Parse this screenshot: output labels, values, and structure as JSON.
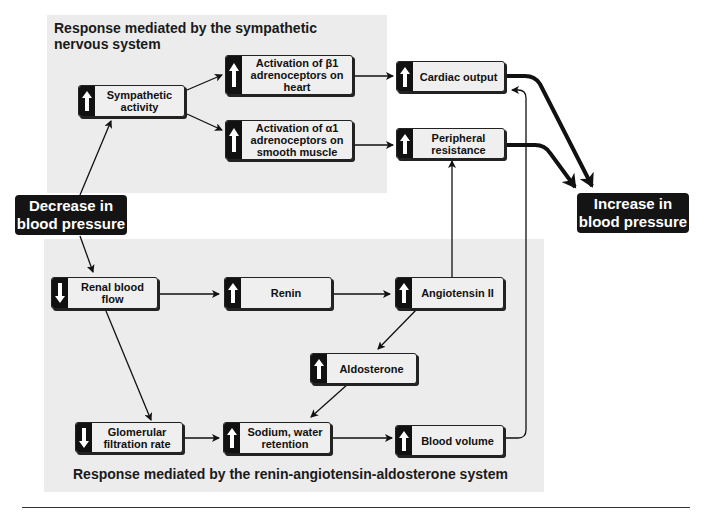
{
  "panels": {
    "sympathetic": {
      "title": "Response mediated by  the sympathetic nervous system"
    },
    "raas": {
      "title": "Response mediated by the renin-angiotensin-aldosterone system"
    }
  },
  "start": {
    "label": "Decrease in blood pressure"
  },
  "end": {
    "label": "Increase in blood pressure"
  },
  "nodes": {
    "sympathetic_activity": {
      "label": "Sympathetic activity",
      "direction": "up"
    },
    "beta1": {
      "label": "Activation of β1 adrenoceptors on heart",
      "direction": "up"
    },
    "alpha1": {
      "label": "Activation of α1 adrenoceptors on smooth muscle",
      "direction": "up"
    },
    "cardiac_output": {
      "label": "Cardiac output",
      "direction": "up"
    },
    "peripheral_resistance": {
      "label": "Peripheral resistance",
      "direction": "up"
    },
    "renal_blood_flow": {
      "label": "Renal blood flow",
      "direction": "down"
    },
    "renin": {
      "label": "Renin",
      "direction": "up"
    },
    "angiotensin_ii": {
      "label": "Angiotensin II",
      "direction": "up"
    },
    "aldosterone": {
      "label": "Aldosterone",
      "direction": "up"
    },
    "gfr": {
      "label": "Glomerular filtration rate",
      "direction": "down"
    },
    "sodium_water": {
      "label": "Sodium, water retention",
      "direction": "up"
    },
    "blood_volume": {
      "label": "Blood volume",
      "direction": "up"
    }
  },
  "icons": {
    "up": "arrow-up-icon",
    "down": "arrow-down-icon"
  },
  "colors": {
    "panel": "#ececec",
    "node": "#efefef",
    "dark": "#141414",
    "line": "#111111"
  }
}
